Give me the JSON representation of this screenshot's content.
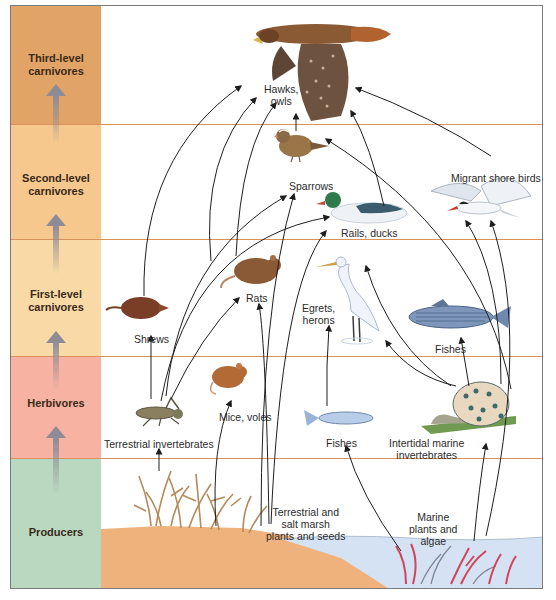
{
  "trophic_levels": [
    {
      "label_line1": "Third-level",
      "label_line2": "carnivores",
      "color": "#e2a466"
    },
    {
      "label_line1": "Second-level",
      "label_line2": "carnivores",
      "color": "#f6c88e"
    },
    {
      "label_line1": "First-level",
      "label_line2": "carnivores",
      "color": "#f9d9a6"
    },
    {
      "label_line1": "Herbivores",
      "label_line2": "",
      "color": "#f7b2a2"
    },
    {
      "label_line1": "Producers",
      "label_line2": "",
      "color": "#b9d8c0"
    }
  ],
  "organisms": {
    "hawks": {
      "line1": "Hawks,",
      "line2": "owls"
    },
    "sparrows": {
      "line1": "Sparrows"
    },
    "rails": {
      "line1": "Rails, ducks"
    },
    "shorebirds": {
      "line1": "Migrant shore birds"
    },
    "shrews": {
      "line1": "Shrews"
    },
    "rats": {
      "line1": "Rats"
    },
    "egrets": {
      "line1": "Egrets,",
      "line2": "herons"
    },
    "fishes_large": {
      "line1": "Fishes"
    },
    "mice": {
      "line1": "Mice, voles"
    },
    "terrestrial_inverts": {
      "line1": "Terrestrial invertebrates"
    },
    "fishes_small": {
      "line1": "Fishes"
    },
    "marine_inverts": {
      "line1": "Intertidal marine",
      "line2": "invertebrates"
    },
    "land_plants": {
      "line1": "Terrestrial and",
      "line2": "salt marsh",
      "line3": "plants and seeds"
    },
    "marine_plants": {
      "line1": "Marine",
      "line2": "plants and",
      "line3": "algae"
    }
  },
  "colors": {
    "band_divider": "#d9925a",
    "arrow": "#1e1e1e",
    "soil": "#efb27c",
    "water": "#d4e2f4",
    "algae_red": "#d0455a"
  }
}
